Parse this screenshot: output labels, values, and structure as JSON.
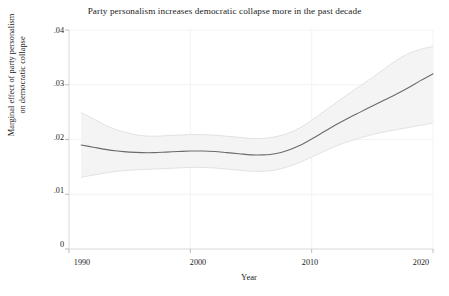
{
  "chart_data": {
    "type": "line",
    "title": "Party personalism increases democratic collapse more in the past decade",
    "xlabel": "Year",
    "ylabel_line1": "Marginal effect of party personalism",
    "ylabel_line2": "on democratic collapse",
    "xlim": [
      1990,
      2020
    ],
    "ylim": [
      0,
      0.04
    ],
    "xticks": [
      1990,
      2000,
      2010,
      2020
    ],
    "xticklabels": [
      "1990",
      "2000",
      "2010",
      "2020"
    ],
    "yticks": [
      0,
      0.01,
      0.02,
      0.03,
      0.04
    ],
    "yticklabels": [
      "0",
      ".01",
      ".02",
      ".03",
      ".04"
    ],
    "grid": true,
    "legend": "none",
    "line_color": "#6b6b6b",
    "band_color": "#f2f2f2",
    "band_edge_color": "#d8d8d8",
    "series": [
      {
        "name": "Marginal effect",
        "x": [
          1991,
          1992,
          1993,
          1994,
          1995,
          1996,
          1997,
          1998,
          1999,
          2000,
          2001,
          2002,
          2003,
          2004,
          2005,
          2006,
          2007,
          2008,
          2009,
          2010,
          2011,
          2012,
          2013,
          2014,
          2015,
          2016,
          2017,
          2018,
          2019,
          2020
        ],
        "values": [
          0.019,
          0.0186,
          0.0182,
          0.0179,
          0.0177,
          0.0176,
          0.0176,
          0.0177,
          0.0178,
          0.0179,
          0.0179,
          0.0178,
          0.0176,
          0.0174,
          0.0172,
          0.0172,
          0.0174,
          0.018,
          0.0189,
          0.0201,
          0.0214,
          0.0227,
          0.0239,
          0.025,
          0.0261,
          0.0272,
          0.0283,
          0.0295,
          0.0308,
          0.032
        ],
        "ci_lower": [
          0.0131,
          0.0135,
          0.0139,
          0.0142,
          0.0144,
          0.0145,
          0.0146,
          0.0147,
          0.0148,
          0.0149,
          0.0149,
          0.0148,
          0.0146,
          0.0144,
          0.0142,
          0.0142,
          0.0144,
          0.015,
          0.0158,
          0.0168,
          0.0178,
          0.0188,
          0.0196,
          0.0203,
          0.0209,
          0.0214,
          0.0218,
          0.0222,
          0.0226,
          0.023
        ],
        "ci_upper": [
          0.0249,
          0.0238,
          0.0226,
          0.0217,
          0.0211,
          0.0207,
          0.0206,
          0.0207,
          0.0208,
          0.0209,
          0.0209,
          0.0208,
          0.0206,
          0.0204,
          0.0202,
          0.0202,
          0.0205,
          0.0211,
          0.0221,
          0.0235,
          0.0251,
          0.0267,
          0.0283,
          0.0298,
          0.0313,
          0.0329,
          0.0345,
          0.0357,
          0.0365,
          0.037
        ]
      }
    ]
  }
}
